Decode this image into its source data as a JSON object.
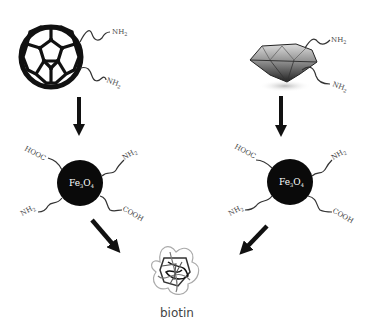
{
  "diagram": {
    "left_branch": {
      "start_material": "fullerene",
      "start_groups": [
        "NH",
        "NH"
      ],
      "start_group_subscript": "2",
      "core": {
        "label_base": "Fe",
        "sub1": "3",
        "mid": "O",
        "sub2": "4"
      },
      "core_groups": {
        "top_left": "HOOC",
        "top_right": "NH",
        "bottom_left": "NH",
        "bottom_right": "COOH",
        "subscript": "2"
      }
    },
    "right_branch": {
      "start_material": "diamond",
      "start_groups": [
        "NH",
        "NH"
      ],
      "start_group_subscript": "2",
      "core": {
        "label_base": "Fe",
        "sub1": "3",
        "mid": "O",
        "sub2": "4"
      },
      "core_groups": {
        "top_left": "HOOC",
        "top_right": "NH",
        "bottom_left": "NH",
        "bottom_right": "COOH",
        "subscript": "2"
      }
    },
    "product": {
      "label": "biotin"
    },
    "colors": {
      "arrow": "#111111",
      "core": "#0a0a0a",
      "text": "#444444"
    }
  }
}
